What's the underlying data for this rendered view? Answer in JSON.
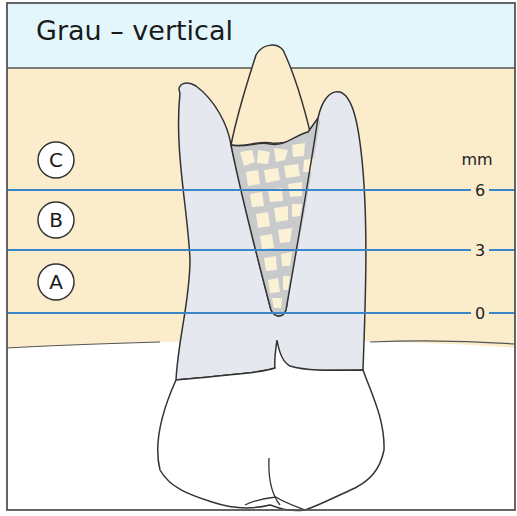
{
  "title": "Grau – vertical",
  "zones": [
    {
      "letter": "C",
      "y": 160
    },
    {
      "letter": "B",
      "y": 220
    },
    {
      "letter": "A",
      "y": 282
    }
  ],
  "scale": {
    "unit": "mm",
    "ticks": [
      {
        "label": "6",
        "y": 190
      },
      {
        "label": "3",
        "y": 250
      },
      {
        "label": "0",
        "y": 313
      }
    ]
  },
  "colors": {
    "title_band": "#e3f6fb",
    "bone": "#fbeccb",
    "root": "#e6e8ef",
    "graft_bg": "#c9cacc",
    "graft_chip": "#fbf2d6",
    "measure_line": "#3a86c8",
    "outline": "#333333",
    "frame": "#555555"
  }
}
